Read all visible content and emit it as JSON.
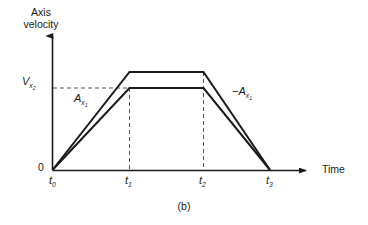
{
  "figure": {
    "caption": "(b)",
    "background_color": "#ffffff",
    "line_color": "#1a1a1a"
  },
  "axes": {
    "y_title_line1": "Axis",
    "y_title_line2": "velocity",
    "x_title": "Time",
    "origin_label": "0"
  },
  "annotations": {
    "velocity_symbol": "V",
    "velocity_subscript": "x",
    "velocity_subscript2": "2",
    "accel_symbol": "A",
    "accel_subscript": "x",
    "accel_subscript2": "1",
    "decel_symbol": "−A",
    "decel_subscript": "x",
    "decel_subscript2": "1"
  },
  "ticks": [
    {
      "symbol": "t",
      "subscript": "0",
      "x": 49
    },
    {
      "symbol": "t",
      "subscript": "1",
      "x": 125
    },
    {
      "symbol": "t",
      "subscript": "2",
      "x": 199
    },
    {
      "symbol": "t",
      "subscript": "3",
      "x": 266
    }
  ],
  "chart_data": {
    "type": "line",
    "title": "",
    "subtitle": "",
    "xlabel": "Time",
    "ylabel": "Axis velocity",
    "grid": false,
    "legend_position": "none",
    "x_tick_labels": [
      "t0",
      "t1",
      "t2",
      "t3"
    ],
    "y_tick_labels": [
      "0",
      "Vx2"
    ],
    "annotations": [
      "Ax1",
      "-Ax1",
      "(b)"
    ],
    "series": [
      {
        "name": "outer trapezoid (higher peak velocity profile)",
        "points": [
          {
            "x": "t0",
            "y": 0
          },
          {
            "x": "t1",
            "y": 1.0
          },
          {
            "x": "t2",
            "y": 1.0
          },
          {
            "x": "t3",
            "y": 0
          }
        ]
      },
      {
        "name": "inner trapezoid (Vx2 plateau velocity profile)",
        "points": [
          {
            "x": "t0",
            "y": 0
          },
          {
            "x": "t1",
            "y": 0.835
          },
          {
            "x": "t2",
            "y": 0.835
          },
          {
            "x": "t3",
            "y": 0
          }
        ]
      }
    ],
    "reference_lines": [
      {
        "name": "Vx2 horizontal dashed",
        "orientation": "horizontal",
        "y": 0.835,
        "from_x": "axis",
        "to_x": "t1",
        "style": "dashed"
      },
      {
        "name": "t1 vertical dashed",
        "orientation": "vertical",
        "x": "t1",
        "from_y": 0,
        "to_y": 0.835,
        "style": "dashed"
      },
      {
        "name": "t2 vertical dashed",
        "orientation": "vertical",
        "x": "t2",
        "from_y": 0,
        "to_y": 1.0,
        "style": "dashed"
      }
    ]
  }
}
